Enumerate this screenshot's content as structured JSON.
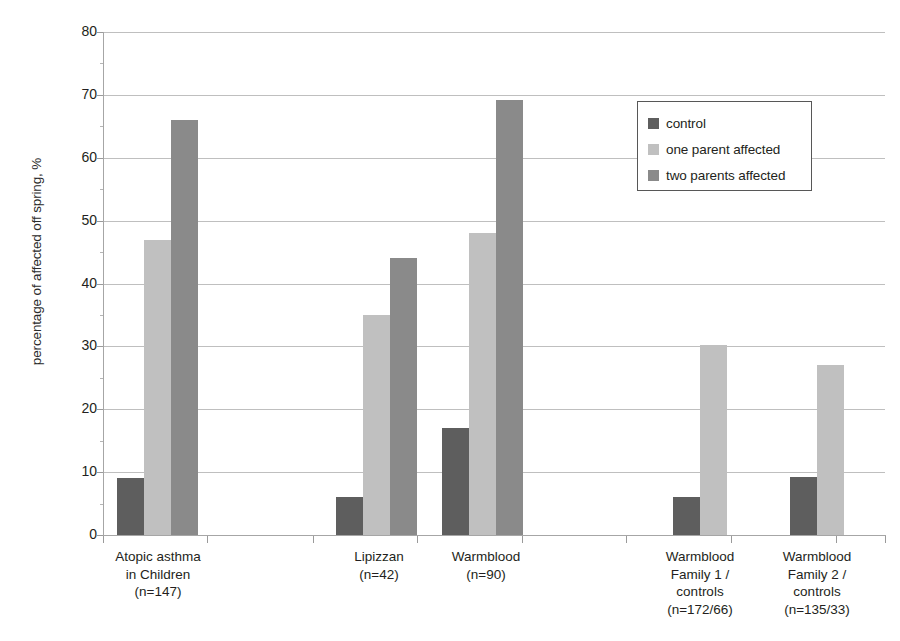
{
  "chart_data": {
    "type": "bar",
    "title": "",
    "xlabel": "",
    "ylabel": "percentage of affected off spring, %",
    "ylim": [
      0,
      80
    ],
    "ytick_step": 10,
    "yticks": [
      0,
      10,
      20,
      30,
      40,
      50,
      60,
      70,
      80
    ],
    "grid": true,
    "legend_position": "top-right",
    "categories": [
      "Atopic asthma\nin Children\n(n=147)",
      "Lipizzan\n(n=42)",
      "Warmblood\n(n=90)",
      "Warmblood\nFamily 1 /\ncontrols\n(n=172/66)",
      "Warmblood\nFamily 2 /\ncontrols\n(n=135/33)"
    ],
    "series": [
      {
        "name": "control",
        "color": "#5e5e5e",
        "values": [
          9,
          6,
          17,
          6,
          9.3
        ]
      },
      {
        "name": "one parent affected",
        "color": "#c0c0c0",
        "values": [
          47,
          35,
          48,
          30.3,
          27
        ]
      },
      {
        "name": "two parents affected",
        "color": "#8a8a8a",
        "values": [
          66,
          44,
          69.2,
          null,
          null
        ]
      }
    ]
  },
  "axis": {
    "y_title": "percentage of affected off spring, %",
    "tick_labels": [
      "80",
      "70",
      "60",
      "50",
      "40",
      "30",
      "20",
      "10",
      "0"
    ]
  },
  "legend": {
    "items": [
      {
        "label": "control",
        "color": "#5e5e5e"
      },
      {
        "label": "one parent affected",
        "color": "#c0c0c0"
      },
      {
        "label": "two parents affected",
        "color": "#8a8a8a"
      }
    ]
  },
  "x_categories": [
    {
      "lines": [
        "Atopic asthma",
        "in Children",
        "(n=147)"
      ]
    },
    {
      "lines": [
        "Lipizzan",
        "(n=42)"
      ]
    },
    {
      "lines": [
        "Warmblood",
        "(n=90)"
      ]
    },
    {
      "lines": [
        "Warmblood",
        "Family 1 /",
        "controls",
        "(n=172/66)"
      ]
    },
    {
      "lines": [
        "Warmblood",
        "Family 2 /",
        "controls",
        "(n=135/33)"
      ]
    }
  ],
  "colors": {
    "control": "#5e5e5e",
    "one_parent": "#c0c0c0",
    "two_parents": "#8a8a8a",
    "gridline": "#bfbfbf",
    "axis": "#a6a6a6",
    "text": "#231f20",
    "background": "#ffffff"
  }
}
